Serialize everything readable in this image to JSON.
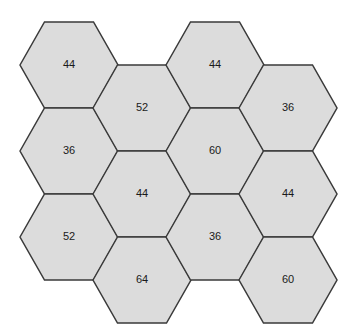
{
  "figure": {
    "kind": "hexagonal-honeycomb-grid",
    "background_color": "#ffffff",
    "cell_fill_color": "#dcdcdc",
    "cell_stroke_color": "#3a3a3a",
    "cell_stroke_width": 1.5,
    "label_color": "#1a1a1a",
    "orientation": "flat-top",
    "columns": 4,
    "rows_per_column": 3,
    "cell_count": 12,
    "hex_radius": 49,
    "hex_half_height": 43,
    "column_step_x": 73,
    "column_offset_y": 43,
    "origin_x": 69,
    "origin_y": 65,
    "top_artifact_left": "· ·",
    "top_artifact_right": "· ·"
  },
  "chart_data": {
    "type": "heatmap",
    "title": "",
    "xlabel": "",
    "ylabel": "",
    "grid": false,
    "legend": "none",
    "cells": [
      {
        "id": "c0r0",
        "col": 0,
        "row": 0,
        "value": 44,
        "label": "44",
        "cx": 69,
        "cy": 65
      },
      {
        "id": "c0r1",
        "col": 0,
        "row": 1,
        "value": 36,
        "label": "36",
        "cx": 69,
        "cy": 151
      },
      {
        "id": "c0r2",
        "col": 0,
        "row": 2,
        "value": 52,
        "label": "52",
        "cx": 69,
        "cy": 237
      },
      {
        "id": "c1r0",
        "col": 1,
        "row": 0,
        "value": 52,
        "label": "52",
        "cx": 142,
        "cy": 108
      },
      {
        "id": "c1r1",
        "col": 1,
        "row": 1,
        "value": 44,
        "label": "44",
        "cx": 142,
        "cy": 194
      },
      {
        "id": "c1r2",
        "col": 1,
        "row": 2,
        "value": 64,
        "label": "64",
        "cx": 142,
        "cy": 280
      },
      {
        "id": "c2r0",
        "col": 2,
        "row": 0,
        "value": 44,
        "label": "44",
        "cx": 215,
        "cy": 65
      },
      {
        "id": "c2r1",
        "col": 2,
        "row": 1,
        "value": 60,
        "label": "60",
        "cx": 215,
        "cy": 151
      },
      {
        "id": "c2r2",
        "col": 2,
        "row": 2,
        "value": 36,
        "label": "36",
        "cx": 215,
        "cy": 237
      },
      {
        "id": "c3r0",
        "col": 3,
        "row": 0,
        "value": 36,
        "label": "36",
        "cx": 288,
        "cy": 108
      },
      {
        "id": "c3r1",
        "col": 3,
        "row": 1,
        "value": 44,
        "label": "44",
        "cx": 288,
        "cy": 194
      },
      {
        "id": "c3r2",
        "col": 3,
        "row": 2,
        "value": 60,
        "label": "60",
        "cx": 288,
        "cy": 280
      }
    ],
    "values": [
      44,
      36,
      52,
      52,
      44,
      64,
      44,
      60,
      36,
      36,
      44,
      60
    ]
  }
}
